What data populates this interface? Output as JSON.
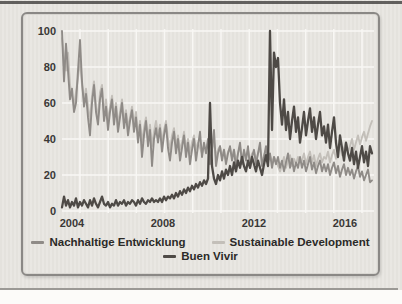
{
  "figure": {
    "background_color": "#e9e7e2",
    "frame_border_color": "#8a8885",
    "top_rule_color": "#4a4846",
    "bottom_rule_color": "#9b9995",
    "gridline_color": "#f8f7f4",
    "tick_text_color": "#3a3836"
  },
  "chart_data": {
    "type": "line",
    "title": "",
    "xlabel": "",
    "ylabel": "",
    "x_unit": "month",
    "x_range": [
      "2004-01",
      "2016-12"
    ],
    "ylim": [
      0,
      100
    ],
    "y_ticks": [
      0,
      20,
      40,
      60,
      80,
      100
    ],
    "x_ticks": [
      "2004",
      "2008",
      "2012",
      "2016"
    ],
    "grid": true,
    "legend_position": "bottom",
    "series": [
      {
        "name": "Nachhaltige Entwicklung",
        "color": "#8f8b87",
        "values": [
          100,
          72,
          93,
          78,
          62,
          68,
          55,
          60,
          78,
          95,
          72,
          58,
          65,
          52,
          42,
          60,
          70,
          55,
          48,
          62,
          68,
          50,
          58,
          45,
          55,
          62,
          48,
          58,
          44,
          52,
          60,
          46,
          54,
          42,
          50,
          56,
          44,
          52,
          38,
          48,
          30,
          42,
          50,
          36,
          45,
          25,
          40,
          46,
          38,
          46,
          33,
          42,
          48,
          35,
          28,
          38,
          44,
          32,
          40,
          28,
          35,
          42,
          30,
          38,
          26,
          34,
          40,
          28,
          36,
          44,
          30,
          38,
          32,
          40,
          26,
          34,
          45,
          25,
          32,
          36,
          28,
          34,
          26,
          32,
          36,
          28,
          34,
          24,
          32,
          38,
          26,
          34,
          28,
          36,
          24,
          30,
          34,
          26,
          32,
          38,
          25,
          30,
          36,
          26,
          32,
          24,
          30,
          26,
          30,
          24,
          28,
          22,
          27,
          32,
          24,
          29,
          22,
          27,
          24,
          30,
          24,
          28,
          22,
          26,
          30,
          23,
          27,
          21,
          25,
          28,
          22,
          26,
          22,
          26,
          20,
          24,
          27,
          21,
          25,
          19,
          23,
          26,
          20,
          24,
          20,
          23,
          18,
          22,
          25,
          19,
          22,
          17,
          20,
          23,
          16,
          17
        ]
      },
      {
        "name": "Sustainable Development",
        "color": "#c3bfb9",
        "values": [
          96,
          85,
          78,
          88,
          70,
          64,
          58,
          66,
          74,
          84,
          70,
          62,
          68,
          58,
          50,
          64,
          72,
          58,
          52,
          66,
          70,
          54,
          62,
          50,
          58,
          64,
          52,
          60,
          48,
          55,
          62,
          50,
          56,
          46,
          52,
          58,
          48,
          55,
          42,
          50,
          38,
          46,
          52,
          40,
          48,
          36,
          44,
          50,
          42,
          48,
          38,
          45,
          50,
          40,
          34,
          42,
          46,
          36,
          42,
          34,
          38,
          44,
          34,
          40,
          32,
          38,
          42,
          34,
          38,
          35,
          32,
          36,
          34,
          38,
          30,
          35,
          38,
          30,
          34,
          36,
          30,
          34,
          28,
          33,
          35,
          30,
          34,
          28,
          32,
          36,
          29,
          33,
          30,
          34,
          28,
          32,
          33,
          28,
          32,
          35,
          27,
          31,
          34,
          28,
          31,
          27,
          30,
          28,
          25,
          22,
          26,
          30,
          24,
          28,
          31,
          25,
          29,
          26,
          30,
          27,
          28,
          32,
          26,
          30,
          33,
          27,
          31,
          25,
          29,
          32,
          27,
          30,
          29,
          33,
          27,
          31,
          34,
          29,
          33,
          36,
          31,
          35,
          38,
          33,
          36,
          40,
          34,
          38,
          42,
          37,
          41,
          44,
          39,
          43,
          47,
          50
        ]
      },
      {
        "name": "Buen Vivir",
        "color": "#4e4a46",
        "values": [
          2,
          8,
          3,
          6,
          2,
          5,
          3,
          7,
          2,
          5,
          3,
          6,
          4,
          2,
          6,
          3,
          7,
          4,
          2,
          5,
          8,
          4,
          3,
          5,
          2,
          4,
          3,
          6,
          3,
          5,
          4,
          6,
          3,
          5,
          4,
          6,
          5,
          3,
          6,
          4,
          7,
          5,
          4,
          6,
          5,
          7,
          5,
          6,
          5,
          7,
          5,
          8,
          6,
          8,
          7,
          9,
          7,
          10,
          8,
          11,
          9,
          12,
          10,
          13,
          11,
          14,
          12,
          15,
          13,
          16,
          14,
          17,
          15,
          18,
          60,
          25,
          18,
          15,
          20,
          17,
          22,
          18,
          23,
          20,
          25,
          20,
          27,
          22,
          28,
          24,
          30,
          25,
          22,
          28,
          24,
          30,
          26,
          22,
          28,
          24,
          20,
          26,
          31,
          25,
          100,
          45,
          88,
          80,
          85,
          60,
          48,
          62,
          45,
          55,
          40,
          50,
          58,
          44,
          52,
          38,
          46,
          55,
          42,
          50,
          57,
          44,
          52,
          40,
          48,
          55,
          42,
          47,
          38,
          48,
          35,
          44,
          52,
          38,
          30,
          42,
          35,
          28,
          38,
          32,
          28,
          35,
          26,
          33,
          24,
          30,
          36,
          27,
          33,
          25,
          36,
          32
        ]
      }
    ]
  }
}
